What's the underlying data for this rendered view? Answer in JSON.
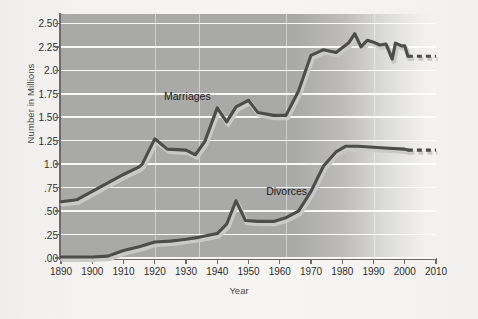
{
  "figure": {
    "y_axis_title": "Number in Millions",
    "x_axis_title": "Year",
    "y_tick_labels": [
      ".00",
      ".25",
      ".50",
      ".75",
      "1.0",
      "1.25",
      "1.50",
      "1.75",
      "2.0",
      "2.25",
      "2.50"
    ],
    "x_tick_labels": [
      "1890",
      "1900",
      "1910",
      "1920",
      "1930",
      "1940",
      "1950",
      "1960",
      "1970",
      "1980",
      "1990",
      "2000",
      "2010"
    ],
    "series_label_marriages": "Marriages",
    "series_label_divorces": "Divorces",
    "colors": {
      "line": "#4c4c4c",
      "line_shadow": "#c9c9c7",
      "plot_background": "#a9a9a7",
      "gridline": "#ffffff",
      "axis": "#6b6b6b",
      "text": "#2f2f2f"
    }
  },
  "chart_data": {
    "type": "line",
    "title": "",
    "xlabel": "Year",
    "ylabel": "Number in Millions",
    "xlim": [
      1890,
      2010
    ],
    "ylim": [
      0.0,
      2.6
    ],
    "yticks": [
      0.0,
      0.25,
      0.5,
      0.75,
      1.0,
      1.25,
      1.5,
      1.75,
      2.0,
      2.25,
      2.5
    ],
    "ytick_labels": [
      ".00",
      ".25",
      ".50",
      ".75",
      "1.0",
      "1.25",
      "1.50",
      "1.75",
      "2.0",
      "2.25",
      "2.50"
    ],
    "xticks": [
      1890,
      1900,
      1910,
      1920,
      1930,
      1940,
      1950,
      1960,
      1970,
      1980,
      1990,
      2000,
      2010
    ],
    "grid": "horizontal",
    "legend": "inline-annotations",
    "series": [
      {
        "name": "Marriages",
        "style": "solid-with-dashed-projection",
        "projection_starts": 2001,
        "points": [
          [
            1890,
            0.6
          ],
          [
            1895,
            0.62
          ],
          [
            1900,
            0.71
          ],
          [
            1905,
            0.8
          ],
          [
            1910,
            0.89
          ],
          [
            1915,
            0.97
          ],
          [
            1916,
            1.0
          ],
          [
            1920,
            1.27
          ],
          [
            1924,
            1.16
          ],
          [
            1930,
            1.15
          ],
          [
            1933,
            1.1
          ],
          [
            1936,
            1.24
          ],
          [
            1940,
            1.6
          ],
          [
            1943,
            1.45
          ],
          [
            1946,
            1.61
          ],
          [
            1950,
            1.68
          ],
          [
            1953,
            1.55
          ],
          [
            1958,
            1.52
          ],
          [
            1962,
            1.52
          ],
          [
            1966,
            1.78
          ],
          [
            1970,
            2.16
          ],
          [
            1974,
            2.22
          ],
          [
            1978,
            2.19
          ],
          [
            1982,
            2.29
          ],
          [
            1984,
            2.39
          ],
          [
            1986,
            2.25
          ],
          [
            1988,
            2.32
          ],
          [
            1990,
            2.3
          ],
          [
            1992,
            2.27
          ],
          [
            1994,
            2.28
          ],
          [
            1996,
            2.12
          ],
          [
            1997,
            2.29
          ],
          [
            1999,
            2.26
          ],
          [
            2000,
            2.26
          ],
          [
            2001,
            2.15
          ],
          [
            2010,
            2.15
          ]
        ]
      },
      {
        "name": "Divorces",
        "style": "solid-with-dashed-projection",
        "projection_starts": 2001,
        "points": [
          [
            1890,
            0.01
          ],
          [
            1900,
            0.01
          ],
          [
            1905,
            0.02
          ],
          [
            1910,
            0.08
          ],
          [
            1915,
            0.12
          ],
          [
            1920,
            0.17
          ],
          [
            1925,
            0.18
          ],
          [
            1930,
            0.2
          ],
          [
            1934,
            0.22
          ],
          [
            1940,
            0.26
          ],
          [
            1943,
            0.36
          ],
          [
            1946,
            0.61
          ],
          [
            1949,
            0.4
          ],
          [
            1953,
            0.39
          ],
          [
            1958,
            0.39
          ],
          [
            1962,
            0.43
          ],
          [
            1966,
            0.5
          ],
          [
            1970,
            0.71
          ],
          [
            1974,
            0.98
          ],
          [
            1978,
            1.13
          ],
          [
            1981,
            1.19
          ],
          [
            1985,
            1.19
          ],
          [
            1990,
            1.18
          ],
          [
            1995,
            1.17
          ],
          [
            2000,
            1.16
          ],
          [
            2001,
            1.15
          ],
          [
            2010,
            1.15
          ]
        ]
      }
    ]
  }
}
